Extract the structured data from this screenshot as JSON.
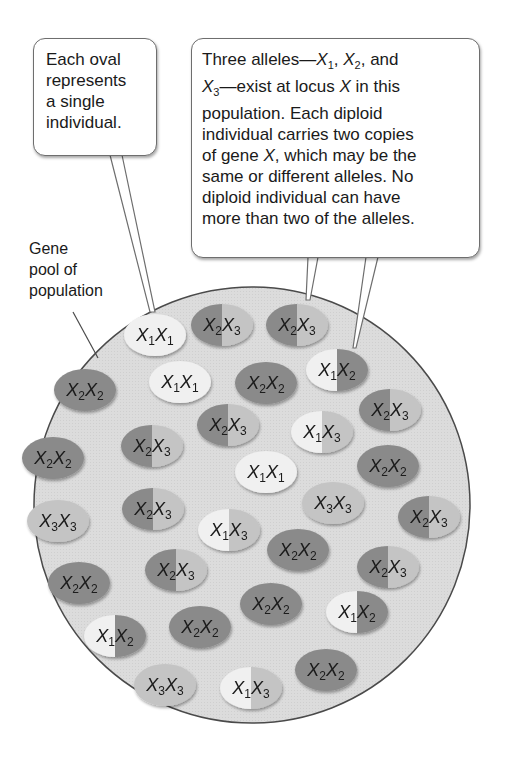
{
  "callouts": {
    "oval_note": {
      "lines": [
        "Each oval",
        "represents",
        "a single",
        "individual."
      ]
    },
    "alleles_note": {
      "line1_pre": "Three alleles—",
      "line1_a1": "X",
      "line1_a1_sub": "1",
      "line1_sep1": ", ",
      "line1_a2": "X",
      "line1_a2_sub": "2",
      "line1_post": ", and",
      "line2_a3": "X",
      "line2_a3_sub": "3",
      "line2_post_pre": "—exist at locus ",
      "line2_locus": "X",
      "line2_post": " in this",
      "line3": "population. Each diploid",
      "line4": "individual carries two copies",
      "line5_pre": "of gene ",
      "line5_gene": "X",
      "line5_post": ", which may be the",
      "line6": "same or different alleles. No",
      "line7": "diploid individual can have",
      "line8": "more than two of the alleles."
    }
  },
  "pool_label": {
    "lines": [
      "Gene",
      "pool of",
      "population"
    ]
  },
  "colors": {
    "pool_fill": "#d9d9d9",
    "pool_stroke": "#4a4a4a",
    "X1": "#f0f0f0",
    "X2": "#8a8a8a",
    "X3": "#c4c4c4"
  },
  "individuals": [
    {
      "genotype": "X1X1",
      "a": "1",
      "b": "1",
      "cx": 155,
      "cy": 335
    },
    {
      "genotype": "X2X3",
      "a": "2",
      "b": "3",
      "cx": 222,
      "cy": 325
    },
    {
      "genotype": "X2X3",
      "a": "2",
      "b": "3",
      "cx": 297,
      "cy": 325
    },
    {
      "genotype": "X1X2",
      "a": "1",
      "b": "2",
      "cx": 337,
      "cy": 370
    },
    {
      "genotype": "X2X2",
      "a": "2",
      "b": "2",
      "cx": 85,
      "cy": 390
    },
    {
      "genotype": "X1X1",
      "a": "1",
      "b": "1",
      "cx": 180,
      "cy": 382
    },
    {
      "genotype": "X2X2",
      "a": "2",
      "b": "2",
      "cx": 266,
      "cy": 383
    },
    {
      "genotype": "X2X3",
      "a": "2",
      "b": "3",
      "cx": 228,
      "cy": 425
    },
    {
      "genotype": "X1X3",
      "a": "1",
      "b": "3",
      "cx": 322,
      "cy": 432
    },
    {
      "genotype": "X2X3",
      "a": "2",
      "b": "3",
      "cx": 390,
      "cy": 410
    },
    {
      "genotype": "X2X2",
      "a": "2",
      "b": "2",
      "cx": 53,
      "cy": 458
    },
    {
      "genotype": "X2X3",
      "a": "2",
      "b": "3",
      "cx": 152,
      "cy": 446
    },
    {
      "genotype": "X1X1",
      "a": "1",
      "b": "1",
      "cx": 266,
      "cy": 472
    },
    {
      "genotype": "X2X2",
      "a": "2",
      "b": "2",
      "cx": 388,
      "cy": 466
    },
    {
      "genotype": "X3X3",
      "a": "3",
      "b": "3",
      "cx": 333,
      "cy": 503
    },
    {
      "genotype": "X2X3",
      "a": "2",
      "b": "3",
      "cx": 153,
      "cy": 509
    },
    {
      "genotype": "X3X3",
      "a": "3",
      "b": "3",
      "cx": 58,
      "cy": 521
    },
    {
      "genotype": "X1X3",
      "a": "1",
      "b": "3",
      "cx": 229,
      "cy": 530
    },
    {
      "genotype": "X2X3",
      "a": "2",
      "b": "3",
      "cx": 429,
      "cy": 517
    },
    {
      "genotype": "X2X2",
      "a": "2",
      "b": "2",
      "cx": 298,
      "cy": 550
    },
    {
      "genotype": "X2X3",
      "a": "2",
      "b": "3",
      "cx": 176,
      "cy": 570
    },
    {
      "genotype": "X2X3",
      "a": "2",
      "b": "3",
      "cx": 388,
      "cy": 567
    },
    {
      "genotype": "X2X2",
      "a": "2",
      "b": "2",
      "cx": 79,
      "cy": 583
    },
    {
      "genotype": "X2X2",
      "a": "2",
      "b": "2",
      "cx": 271,
      "cy": 604
    },
    {
      "genotype": "X1X2",
      "a": "1",
      "b": "2",
      "cx": 357,
      "cy": 612
    },
    {
      "genotype": "X1X2",
      "a": "1",
      "b": "2",
      "cx": 115,
      "cy": 636
    },
    {
      "genotype": "X2X2",
      "a": "2",
      "b": "2",
      "cx": 200,
      "cy": 627
    },
    {
      "genotype": "X3X3",
      "a": "3",
      "b": "3",
      "cx": 165,
      "cy": 685
    },
    {
      "genotype": "X1X3",
      "a": "1",
      "b": "3",
      "cx": 251,
      "cy": 688
    },
    {
      "genotype": "X2X2",
      "a": "2",
      "b": "2",
      "cx": 326,
      "cy": 670
    }
  ]
}
